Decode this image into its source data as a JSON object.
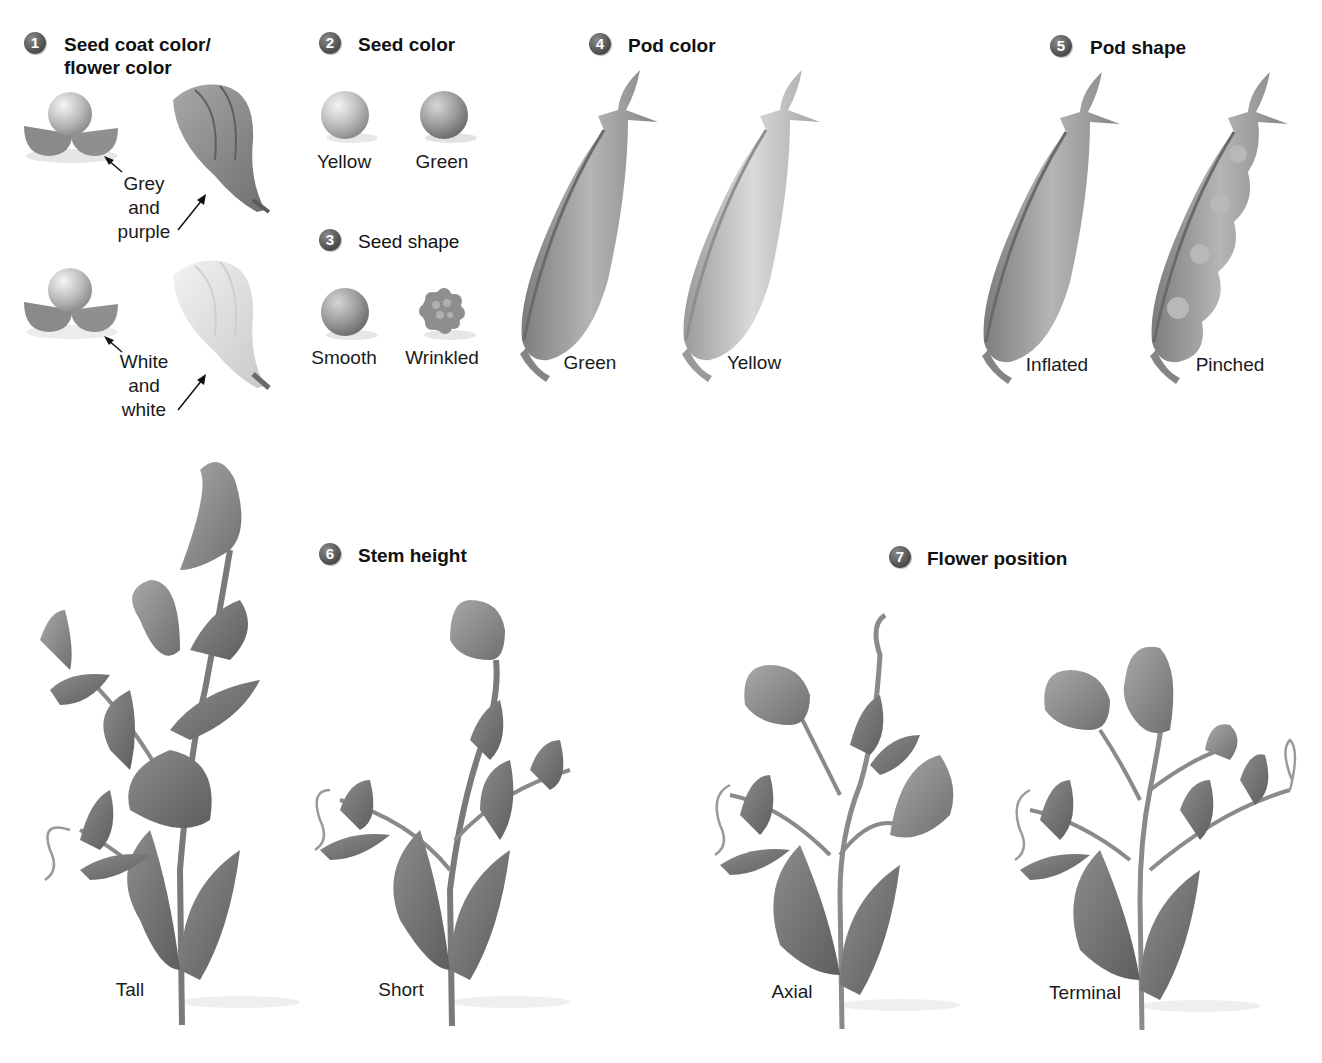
{
  "figure": {
    "traits": [
      {
        "number": "1",
        "title_line1": "Seed coat color/",
        "title_line2": "flower color",
        "variants": [
          {
            "label_line1": "Grey",
            "label_line2": "and",
            "label_line3": "purple"
          },
          {
            "label_line1": "White",
            "label_line2": "and",
            "label_line3": "white"
          }
        ]
      },
      {
        "number": "2",
        "title": "Seed color",
        "variants": [
          {
            "label": "Yellow"
          },
          {
            "label": "Green"
          }
        ]
      },
      {
        "number": "3",
        "title": "Seed shape",
        "variants": [
          {
            "label": "Smooth"
          },
          {
            "label": "Wrinkled"
          }
        ]
      },
      {
        "number": "4",
        "title": "Pod color",
        "variants": [
          {
            "label": "Green"
          },
          {
            "label": "Yellow"
          }
        ]
      },
      {
        "number": "5",
        "title": "Pod shape",
        "variants": [
          {
            "label": "Inflated"
          },
          {
            "label": "Pinched"
          }
        ]
      },
      {
        "number": "6",
        "title": "Stem height",
        "variants": [
          {
            "label": "Tall"
          },
          {
            "label": "Short"
          }
        ]
      },
      {
        "number": "7",
        "title": "Flower position",
        "variants": [
          {
            "label": "Axial"
          },
          {
            "label": "Terminal"
          }
        ]
      }
    ],
    "colors": {
      "badge": "#5a5a5a",
      "illustration_dark": "#6e6e6e",
      "illustration_mid": "#9a9a9a",
      "illustration_light": "#d4d4d4",
      "text": "#1a1a1a"
    }
  }
}
